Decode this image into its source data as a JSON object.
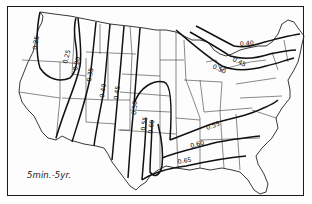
{
  "map": {
    "title": "5min.-5yr.",
    "region": "Contiguous United States",
    "contour_labels": {
      "l025a": "0.25",
      "l025b": "0.25",
      "l030": "0.30",
      "l035": "0.35",
      "l040w": "0.40",
      "l045": "0.45",
      "l050w": "0.50",
      "l055w": "0.55",
      "l060w": "0.60",
      "l040ne": "0.40",
      "l045ne": "0.45",
      "l050ne": "0.50",
      "l055se": "0.55",
      "l060se": "0.60",
      "l065se": "0.65"
    },
    "colors": {
      "line": "#111111",
      "background": "#ffffff"
    }
  }
}
